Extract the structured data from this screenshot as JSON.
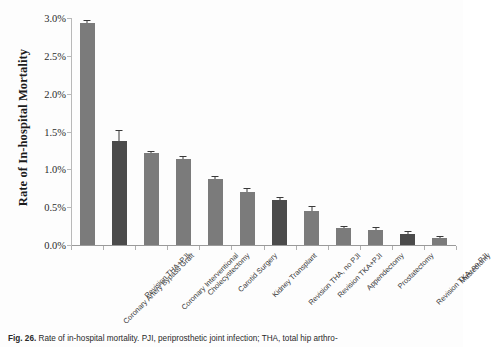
{
  "figure": {
    "caption_label": "Fig. 26.",
    "caption_text": "Rate of in-hospital mortality. PJI, periprosthetic joint infection; THA, total hip arthro-"
  },
  "chart_data": {
    "type": "bar",
    "title": "",
    "xlabel": "",
    "ylabel": "Rate of In-hospital Mortality",
    "ylim": [
      0,
      3.0
    ],
    "ytick_labels": [
      "0.0%",
      "0.5%",
      "1.0%",
      "1.5%",
      "2.0%",
      "2.5%",
      "3.0%"
    ],
    "ytick_values": [
      0,
      0.5,
      1.0,
      1.5,
      2.0,
      2.5,
      3.0
    ],
    "grid": false,
    "legend": "none",
    "value_unit": "%",
    "categories": [
      "Coronary Artery Bypass Graft",
      "Revision THA+PJI",
      "Coronary Interventional",
      "Cholecystectomy",
      "Carotid Surgery",
      "Kidney Transplant",
      "Revision THA, no PJI",
      "Revision TKA+PJI",
      "Appendectomy",
      "Prostatectomy",
      "Revision TKA, no PJI",
      "Mastectomy"
    ],
    "values": [
      2.93,
      1.38,
      1.21,
      1.14,
      0.87,
      0.7,
      0.6,
      0.45,
      0.22,
      0.2,
      0.15,
      0.09
    ],
    "errors": [
      0.03,
      0.13,
      0.02,
      0.02,
      0.03,
      0.04,
      0.02,
      0.05,
      0.02,
      0.02,
      0.02,
      0.01
    ],
    "bar_colors": [
      "#7b7b7b",
      "#4b4b4b",
      "#7b7b7b",
      "#7b7b7b",
      "#7b7b7b",
      "#7b7b7b",
      "#4b4b4b",
      "#7b7b7b",
      "#7b7b7b",
      "#7b7b7b",
      "#4b4b4b",
      "#7b7b7b"
    ],
    "error_bar_color": "#3a3a3a",
    "axis_color": "#b0b0b0"
  }
}
